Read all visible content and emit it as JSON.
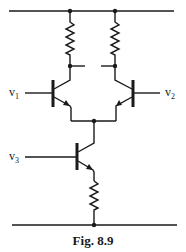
{
  "figure": {
    "caption": "Fig. 8.9",
    "type": "circuit-schematic"
  },
  "labels": {
    "v1": "v",
    "v1_sub": "1",
    "v2": "v",
    "v2_sub": "2",
    "v3": "v",
    "v3_sub": "3"
  },
  "components": [
    {
      "id": "R1",
      "type": "resistor",
      "position": "left collector"
    },
    {
      "id": "R2",
      "type": "resistor",
      "position": "right collector"
    },
    {
      "id": "Q1",
      "type": "npn-transistor",
      "input": "v1"
    },
    {
      "id": "Q2",
      "type": "npn-transistor",
      "input": "v2"
    },
    {
      "id": "Q3",
      "type": "npn-transistor",
      "input": "v3"
    },
    {
      "id": "R3",
      "type": "resistor",
      "position": "emitter of Q3"
    }
  ],
  "colors": {
    "ink": "#1a1a1a",
    "background": "#ffffff"
  }
}
